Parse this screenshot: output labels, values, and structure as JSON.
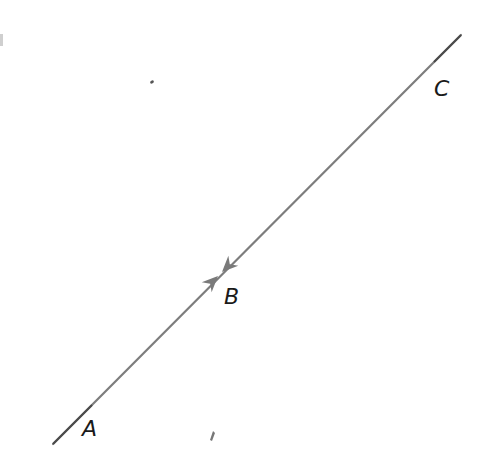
{
  "diagram": {
    "type": "line-with-arrows",
    "colors": {
      "line": "#7a7a7a",
      "line_end": "#444444",
      "arrow": "#7a7a7a",
      "label": "#1a1a1a",
      "background": "#ffffff"
    },
    "points": [
      {
        "id": "A",
        "label": "A",
        "x": 88,
        "y": 430
      },
      {
        "id": "B",
        "label": "B",
        "x": 230,
        "y": 300
      },
      {
        "id": "C",
        "label": "C",
        "x": 440,
        "y": 92
      }
    ],
    "line": {
      "x1": 53,
      "y1": 444,
      "x2": 461,
      "y2": 35
    },
    "arrows": [
      {
        "from": "A",
        "toward": "B",
        "tip_x": 218,
        "tip_y": 276
      },
      {
        "from": "C",
        "toward": "B",
        "tip_x": 222,
        "tip_y": 272
      }
    ],
    "labels": {
      "A": "A",
      "B": "B",
      "C": "C"
    }
  }
}
